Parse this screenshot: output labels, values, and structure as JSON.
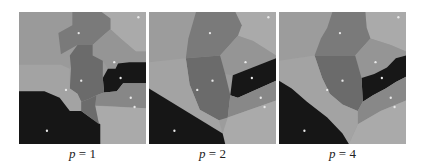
{
  "figure": {
    "panels": [
      {
        "id": "p1",
        "label_var": "p",
        "label_eq": " = ",
        "label_val": "1"
      },
      {
        "id": "p2",
        "label_var": "p",
        "label_eq": " = ",
        "label_val": "2"
      },
      {
        "id": "p4",
        "label_var": "p",
        "label_eq": " = ",
        "label_val": "4"
      }
    ]
  },
  "colors": {
    "light": "#a9a9a9",
    "mid": "#949494",
    "darkgray": "#7b7b7b",
    "deep": "#6c6c6c",
    "black": "#181818",
    "site": "#e6e6e6"
  }
}
